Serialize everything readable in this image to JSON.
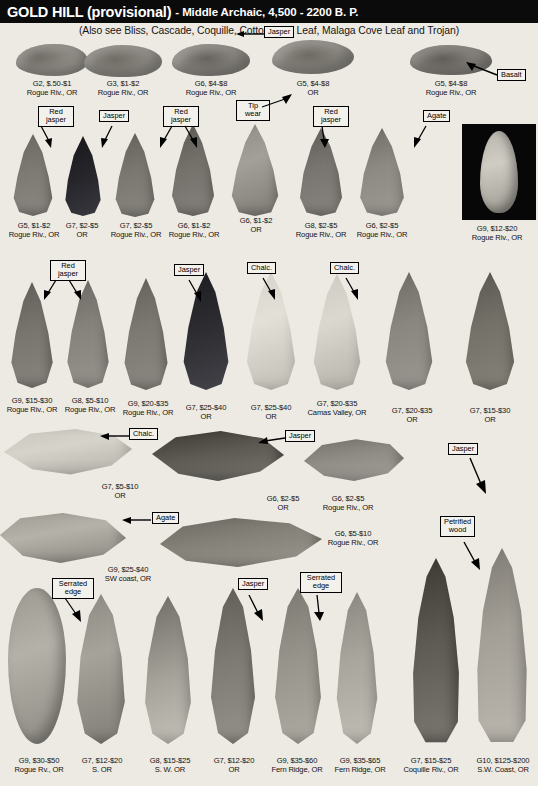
{
  "header": {
    "title_main": "GOLD HILL (provisional)",
    "title_sub": "- Middle Archaic, 4,500 - 2200 B. P.",
    "subtitle": "(Also see Bliss, Cascade, Coquille, Cottonwood Leaf, Malaga Cove Leaf and Trojan)"
  },
  "callouts": [
    {
      "id": "c-jasper-r1",
      "text": "Jasper"
    },
    {
      "id": "c-basalt-r1",
      "text": "Basalt"
    },
    {
      "id": "c-redjasper-1",
      "text": "Red\njasper"
    },
    {
      "id": "c-jasper-2",
      "text": "Jasper"
    },
    {
      "id": "c-redjasper-2",
      "text": "Red\njasper"
    },
    {
      "id": "c-tipwear",
      "text": "Tip\nwear"
    },
    {
      "id": "c-redjasper-3",
      "text": "Red\njasper"
    },
    {
      "id": "c-agate-1",
      "text": "Agate"
    },
    {
      "id": "c-redjasper-4",
      "text": "Red\njasper"
    },
    {
      "id": "c-jasper-3",
      "text": "Jasper"
    },
    {
      "id": "c-chalc-1",
      "text": "Chalc."
    },
    {
      "id": "c-chalc-2",
      "text": "Chalc."
    },
    {
      "id": "c-chalc-3",
      "text": "Chalc."
    },
    {
      "id": "c-jasper-4",
      "text": "Jasper"
    },
    {
      "id": "c-jasper-5",
      "text": "Jasper"
    },
    {
      "id": "c-agate-2",
      "text": "Agate"
    },
    {
      "id": "c-petwood",
      "text": "Petrified\nwood"
    },
    {
      "id": "c-serrated-1",
      "text": "Serrated\nedge"
    },
    {
      "id": "c-jasper-6",
      "text": "Jasper"
    },
    {
      "id": "c-serrated-2",
      "text": "Serrated\nedge"
    }
  ],
  "rows": [
    {
      "name": "row-1",
      "artifacts": [
        {
          "grade_price": "G2, $.50-$1",
          "locality": "Rogue Riv., OR"
        },
        {
          "grade_price": "G3, $1-$2",
          "locality": "Rogue Riv., OR"
        },
        {
          "grade_price": "G6, $4-$8",
          "locality": "Rogue Riv., OR"
        },
        {
          "grade_price": "G5, $4-$8",
          "locality": "OR"
        },
        {
          "grade_price": "G5, $4-$8",
          "locality": "Rogue Riv., OR"
        }
      ]
    },
    {
      "name": "row-2",
      "artifacts": [
        {
          "grade_price": "G5, $1-$2",
          "locality": "Rogue Riv., OR"
        },
        {
          "grade_price": "G7, $2-$5",
          "locality": "OR"
        },
        {
          "grade_price": "G7, $2-$5",
          "locality": "Rogue Riv., OR"
        },
        {
          "grade_price": "G6, $1-$2",
          "locality": "Rogue Riv., OR"
        },
        {
          "grade_price": "G6, $1-$2",
          "locality": "OR"
        },
        {
          "grade_price": "G8, $2-$5",
          "locality": "Rogue Riv., OR"
        },
        {
          "grade_price": "G6, $2-$5",
          "locality": "Rogue Riv., OR"
        },
        {
          "grade_price": "G9, $12-$20",
          "locality": "Rogue Riv., OR"
        }
      ]
    },
    {
      "name": "row-3",
      "artifacts": [
        {
          "grade_price": "G9, $15-$30",
          "locality": "Rogue Riv., OR"
        },
        {
          "grade_price": "G8, $5-$10",
          "locality": "Rogue Riv., OR"
        },
        {
          "grade_price": "G9, $20-$35",
          "locality": "Rogue Riv., OR"
        },
        {
          "grade_price": "G7, $25-$40",
          "locality": "OR"
        },
        {
          "grade_price": "G7, $25-$40",
          "locality": "OR"
        },
        {
          "grade_price": "G7, $20-$35",
          "locality": "Camas Valley, OR"
        },
        {
          "grade_price": "G7, $20-$35",
          "locality": "OR"
        },
        {
          "grade_price": "G7, $15-$30",
          "locality": "OR"
        }
      ]
    },
    {
      "name": "row-4",
      "artifacts": [
        {
          "grade_price": "G7, $5-$10",
          "locality": "OR"
        },
        {
          "grade_price": "G6, $2-$5",
          "locality": "OR"
        },
        {
          "grade_price": "G6, $2-$5",
          "locality": "Rogue Riv., OR"
        }
      ]
    },
    {
      "name": "row-5",
      "artifacts": [
        {
          "grade_price": "G9, $25-$40",
          "locality": "SW coast, OR"
        },
        {
          "grade_price": "G6, $5-$10",
          "locality": "Rogue Riv., OR"
        }
      ]
    },
    {
      "name": "row-6",
      "artifacts": [
        {
          "grade_price": "G9, $30-$50",
          "locality": "Rogue Rv., OR"
        },
        {
          "grade_price": "G7, $12-$20",
          "locality": "S. OR"
        },
        {
          "grade_price": "G8, $15-$25",
          "locality": "S. W. OR"
        },
        {
          "grade_price": "G7, $12-$20",
          "locality": "OR"
        },
        {
          "grade_price": "G9, $35-$60",
          "locality": "Fern Ridge, OR"
        },
        {
          "grade_price": "G9, $35-$65",
          "locality": "Fern Ridge, OR"
        },
        {
          "grade_price": "G7, $15-$25",
          "locality": "Coquille Riv., OR"
        },
        {
          "grade_price": "G10, $125-$200",
          "locality": "S.W. Coast, OR"
        }
      ]
    }
  ]
}
